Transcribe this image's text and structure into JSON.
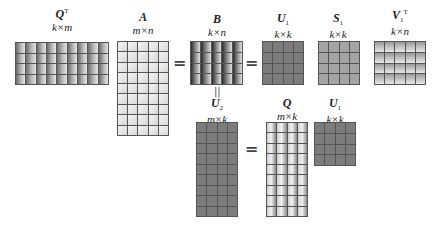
{
  "diagram": {
    "row1": {
      "matrices": [
        {
          "id": "QT",
          "name": "Q",
          "sup": "T",
          "sub": "",
          "dim": "k×m",
          "rows": 4,
          "cols": 9,
          "style": "gradient-mid"
        },
        {
          "id": "A",
          "name": "A",
          "sup": "",
          "sub": "",
          "dim": "m×n",
          "rows": 9,
          "cols": 5,
          "style": "light"
        },
        {
          "id": "B",
          "name": "B",
          "sup": "",
          "sub": "",
          "dim": "k×n",
          "rows": 4,
          "cols": 5,
          "style": "gradient-dark"
        },
        {
          "id": "U1",
          "name": "U",
          "sup": "",
          "sub": "1",
          "dim": "k×k",
          "rows": 4,
          "cols": 4,
          "style": "flat-dark"
        },
        {
          "id": "S1",
          "name": "S",
          "sup": "",
          "sub": "1",
          "dim": "k×k",
          "rows": 4,
          "cols": 4,
          "style": "flat-mid"
        },
        {
          "id": "V1T",
          "name": "V",
          "sup": "T",
          "sub": "1",
          "dim": "k×n",
          "rows": 4,
          "cols": 5,
          "style": "gray-light"
        }
      ],
      "operators": [
        "=",
        "="
      ]
    },
    "link": "||",
    "row2": {
      "matrices": [
        {
          "id": "U2",
          "name": "U",
          "sup": "",
          "sub": "2",
          "dim": "m×k",
          "rows": 9,
          "cols": 4,
          "style": "flat-dark"
        },
        {
          "id": "Q",
          "name": "Q",
          "sup": "",
          "sub": "",
          "dim": "m×k",
          "rows": 9,
          "cols": 4,
          "style": "q-gradient"
        },
        {
          "id": "U1b",
          "name": "U",
          "sup": "",
          "sub": "1",
          "dim": "k×k",
          "rows": 4,
          "cols": 4,
          "style": "flat-dark"
        }
      ],
      "operators": [
        "="
      ]
    }
  }
}
